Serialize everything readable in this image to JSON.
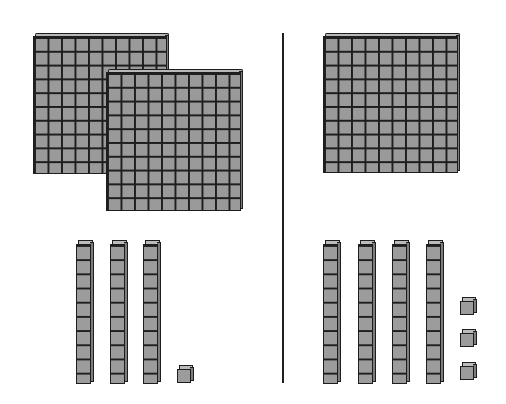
{
  "diagram": {
    "type": "base-ten-blocks",
    "colors": {
      "block_fill": "#9a9a9a",
      "block_edge": "#1e1e1e",
      "top_face": "#b8b8b8",
      "side_face": "#7d7d7d",
      "background": "#ffffff"
    },
    "divider": {
      "x": 282,
      "y_top": 33,
      "y_bottom": 383
    },
    "left_group": {
      "flats": [
        {
          "name": "hundred-flat-back",
          "x": 33,
          "y": 33,
          "w": 137,
          "h": 141
        },
        {
          "name": "hundred-flat-front",
          "x": 106,
          "y": 69,
          "w": 138,
          "h": 142
        }
      ],
      "rods": [
        {
          "x": 76,
          "y": 240,
          "h": 144
        },
        {
          "x": 110,
          "y": 240,
          "h": 144
        },
        {
          "x": 143,
          "y": 240,
          "h": 144
        }
      ],
      "units": [
        {
          "x": 177,
          "y": 365
        }
      ],
      "counts": {
        "hundreds": 2,
        "tens": 3,
        "ones": 1
      }
    },
    "right_group": {
      "flats": [
        {
          "name": "hundred-flat",
          "x": 323,
          "y": 33,
          "w": 138,
          "h": 140
        }
      ],
      "rods": [
        {
          "x": 323,
          "y": 240,
          "h": 144
        },
        {
          "x": 358,
          "y": 240,
          "h": 144
        },
        {
          "x": 392,
          "y": 240,
          "h": 144
        },
        {
          "x": 426,
          "y": 240,
          "h": 144
        }
      ],
      "units": [
        {
          "x": 460,
          "y": 297
        },
        {
          "x": 460,
          "y": 329
        },
        {
          "x": 460,
          "y": 362
        }
      ],
      "counts": {
        "hundreds": 1,
        "tens": 4,
        "ones": 3
      }
    }
  }
}
